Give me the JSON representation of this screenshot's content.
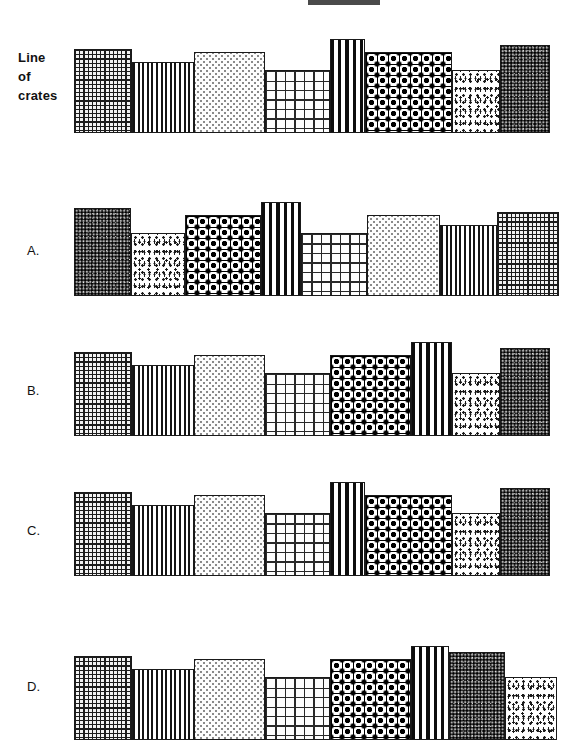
{
  "page": {
    "background_color": "#ffffff",
    "width": 580,
    "height": 744
  },
  "top_bar": {
    "name": "header-rule",
    "color": "#4a4a4a",
    "x": 308,
    "y": 0,
    "width": 72,
    "height": 5
  },
  "patterns": {
    "fine-grid": {
      "label": "fine dark grid",
      "css_class": "pat-fine-grid",
      "ink": "#1c1c1c"
    },
    "vstripe-thin": {
      "label": "thin vertical stripes",
      "css_class": "pat-vstripe-thin",
      "ink": "#141414"
    },
    "light-dots": {
      "label": "light sparse dots",
      "css_class": "pat-light-dots",
      "ink": "#8a8a8a"
    },
    "coarse-grid": {
      "label": "coarse open grid",
      "css_class": "pat-coarse-grid",
      "ink": "#2a2a2a"
    },
    "vstripe-bold": {
      "label": "bold vertical stripes",
      "css_class": "pat-vstripe-bold",
      "ink": "#0d0d0d"
    },
    "diamond": {
      "label": "black diamond lattice",
      "css_class": "pat-diamond",
      "ink": "#000000"
    },
    "medium-dots": {
      "label": "medium speckle dots",
      "css_class": "pat-medium-dots",
      "ink": "#1a1a1a"
    },
    "dark-dense": {
      "label": "dense dark speckle",
      "css_class": "pat-dark-dense",
      "ink": "#2e2e2e"
    }
  },
  "rows": [
    {
      "id": "reference",
      "label": "Line\nof\ncrates",
      "label_bold": true,
      "label_x": 18,
      "label_y": 48,
      "top": 33,
      "height": 100,
      "crates": [
        {
          "pattern": "fine-grid",
          "x": 74,
          "width": 58,
          "height": 84
        },
        {
          "pattern": "vstripe-thin",
          "x": 132,
          "width": 62,
          "height": 71
        },
        {
          "pattern": "light-dots",
          "x": 194,
          "width": 71,
          "height": 81
        },
        {
          "pattern": "coarse-grid",
          "x": 265,
          "width": 65,
          "height": 63
        },
        {
          "pattern": "vstripe-bold",
          "x": 330,
          "width": 35,
          "height": 94
        },
        {
          "pattern": "diamond",
          "x": 365,
          "width": 87,
          "height": 81
        },
        {
          "pattern": "medium-dots",
          "x": 452,
          "width": 48,
          "height": 63
        },
        {
          "pattern": "dark-dense",
          "x": 500,
          "width": 50,
          "height": 88
        }
      ]
    },
    {
      "id": "option-a",
      "label": "A.",
      "label_bold": false,
      "label_x": 27,
      "label_y": 241,
      "top": 186,
      "height": 110,
      "crates": [
        {
          "pattern": "dark-dense",
          "x": 74,
          "width": 57,
          "height": 88
        },
        {
          "pattern": "medium-dots",
          "x": 131,
          "width": 54,
          "height": 63
        },
        {
          "pattern": "diamond",
          "x": 185,
          "width": 76,
          "height": 81
        },
        {
          "pattern": "vstripe-bold",
          "x": 261,
          "width": 40,
          "height": 94
        },
        {
          "pattern": "coarse-grid",
          "x": 301,
          "width": 66,
          "height": 63
        },
        {
          "pattern": "light-dots",
          "x": 367,
          "width": 73,
          "height": 81
        },
        {
          "pattern": "vstripe-thin",
          "x": 440,
          "width": 57,
          "height": 71
        },
        {
          "pattern": "fine-grid",
          "x": 497,
          "width": 62,
          "height": 84
        }
      ]
    },
    {
      "id": "option-b",
      "label": "B.",
      "label_bold": false,
      "label_x": 27,
      "label_y": 381,
      "top": 326,
      "height": 110,
      "crates": [
        {
          "pattern": "fine-grid",
          "x": 74,
          "width": 58,
          "height": 84
        },
        {
          "pattern": "vstripe-thin",
          "x": 132,
          "width": 62,
          "height": 71
        },
        {
          "pattern": "light-dots",
          "x": 194,
          "width": 71,
          "height": 81
        },
        {
          "pattern": "coarse-grid",
          "x": 265,
          "width": 65,
          "height": 63
        },
        {
          "pattern": "diamond",
          "x": 330,
          "width": 81,
          "height": 81
        },
        {
          "pattern": "vstripe-bold",
          "x": 411,
          "width": 41,
          "height": 94
        },
        {
          "pattern": "medium-dots",
          "x": 452,
          "width": 48,
          "height": 63
        },
        {
          "pattern": "dark-dense",
          "x": 500,
          "width": 50,
          "height": 88
        }
      ]
    },
    {
      "id": "option-c",
      "label": "C.",
      "label_bold": false,
      "label_x": 27,
      "label_y": 521,
      "top": 466,
      "height": 110,
      "crates": [
        {
          "pattern": "fine-grid",
          "x": 74,
          "width": 58,
          "height": 84
        },
        {
          "pattern": "vstripe-thin",
          "x": 132,
          "width": 62,
          "height": 71
        },
        {
          "pattern": "light-dots",
          "x": 194,
          "width": 71,
          "height": 81
        },
        {
          "pattern": "coarse-grid",
          "x": 265,
          "width": 65,
          "height": 63
        },
        {
          "pattern": "vstripe-bold",
          "x": 330,
          "width": 35,
          "height": 94
        },
        {
          "pattern": "diamond",
          "x": 365,
          "width": 87,
          "height": 81
        },
        {
          "pattern": "medium-dots",
          "x": 452,
          "width": 48,
          "height": 63
        },
        {
          "pattern": "dark-dense",
          "x": 500,
          "width": 50,
          "height": 88
        }
      ]
    },
    {
      "id": "option-d",
      "label": "D.",
      "label_bold": false,
      "label_x": 27,
      "label_y": 677,
      "top": 622,
      "height": 118,
      "crates": [
        {
          "pattern": "fine-grid",
          "x": 74,
          "width": 58,
          "height": 84
        },
        {
          "pattern": "vstripe-thin",
          "x": 132,
          "width": 62,
          "height": 71
        },
        {
          "pattern": "light-dots",
          "x": 194,
          "width": 71,
          "height": 81
        },
        {
          "pattern": "coarse-grid",
          "x": 265,
          "width": 65,
          "height": 63
        },
        {
          "pattern": "diamond",
          "x": 330,
          "width": 81,
          "height": 81
        },
        {
          "pattern": "vstripe-bold",
          "x": 411,
          "width": 38,
          "height": 94
        },
        {
          "pattern": "dark-dense",
          "x": 449,
          "width": 56,
          "height": 88
        },
        {
          "pattern": "medium-dots",
          "x": 505,
          "width": 52,
          "height": 63
        }
      ]
    }
  ]
}
